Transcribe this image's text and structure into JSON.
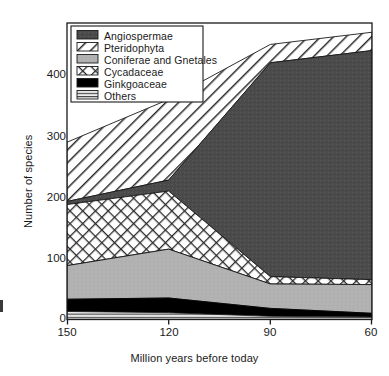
{
  "chart_data": {
    "type": "area",
    "stacked": true,
    "title": "",
    "xlabel": "Million years before today",
    "ylabel": "Number of species",
    "x": [
      150,
      120,
      90,
      60
    ],
    "xticks": [
      "150",
      "120",
      "90",
      "60"
    ],
    "xlim": [
      150,
      60
    ],
    "x_axis_reversed": true,
    "yticks": [
      "0",
      "100",
      "200",
      "300",
      "400"
    ],
    "ytick_values": [
      0,
      100,
      200,
      300,
      400
    ],
    "ylim": [
      0,
      470
    ],
    "grid": false,
    "legend_position": "top-left-inside",
    "stack_order_bottom_to_top": [
      "Others",
      "Ginkgoaceae",
      "Coniferae and Gnetales",
      "Cycadaceae",
      "Angiospermae",
      "Pteridophyta"
    ],
    "series": [
      {
        "name": "Angiospermae",
        "pattern": "solid-dark",
        "color": "#4a4a4a",
        "values": [
          5,
          18,
          350,
          375
        ]
      },
      {
        "name": "Pteridophyta",
        "pattern": "diagonal-hatch",
        "color": "#ffffff",
        "values": [
          97,
          132,
          30,
          30
        ]
      },
      {
        "name": "Coniferae and Gnetales",
        "pattern": "solid-gray",
        "color": "#b0b0b0",
        "values": [
          55,
          80,
          40,
          47
        ]
      },
      {
        "name": "Cycadaceae",
        "pattern": "cross-hatch",
        "color": "#ffffff",
        "values": [
          100,
          95,
          12,
          8
        ]
      },
      {
        "name": "Ginkgoaceae",
        "pattern": "solid-black",
        "color": "#000000",
        "values": [
          20,
          24,
          13,
          6
        ]
      },
      {
        "name": "Others",
        "pattern": "horizontal-lines",
        "color": "#e8e8e8",
        "values": [
          13,
          11,
          5,
          4
        ]
      }
    ],
    "cumulative_boundaries": {
      "others_top": [
        13,
        11,
        5,
        4
      ],
      "ginkgoaceae_top": [
        33,
        35,
        18,
        10
      ],
      "coniferae_top": [
        88,
        115,
        58,
        57
      ],
      "cycadaceae_top": [
        188,
        210,
        70,
        65
      ],
      "angiospermae_top": [
        193,
        228,
        420,
        440
      ],
      "pteridophyta_top": [
        290,
        360,
        450,
        470
      ]
    }
  },
  "legend": {
    "items": [
      {
        "label": "Angiospermae",
        "swatch": "solid-dark"
      },
      {
        "label": "Pteridophyta",
        "swatch": "diagonal-hatch"
      },
      {
        "label": "Coniferae and Gnetales",
        "swatch": "solid-gray"
      },
      {
        "label": "Cycadaceae",
        "swatch": "cross-hatch"
      },
      {
        "label": "Ginkgoaceae",
        "swatch": "solid-black"
      },
      {
        "label": "Others",
        "swatch": "horizontal-lines"
      }
    ]
  },
  "axes": {
    "ylabel": "Number of species",
    "xlabel": "Million years before today",
    "yticks": [
      "400",
      "300",
      "200",
      "100",
      "0"
    ],
    "xticks": [
      "150",
      "120",
      "90",
      "60"
    ]
  },
  "colors": {
    "angiospermae": "#4a4a4a",
    "coniferae": "#b0b0b0",
    "ginkgoaceae": "#000000",
    "others": "#e8e8e8",
    "axis": "#1a1a1a",
    "background": "#ffffff"
  }
}
